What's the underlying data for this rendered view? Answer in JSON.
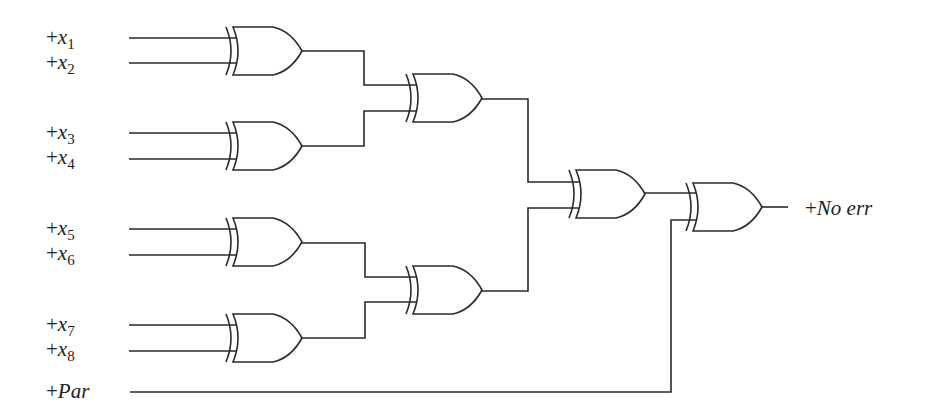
{
  "diagram": {
    "type": "xor-parity-checker",
    "inputs": [
      {
        "id": "x1",
        "plus": "+",
        "var": "x",
        "sub": "1"
      },
      {
        "id": "x2",
        "plus": "+",
        "var": "x",
        "sub": "2"
      },
      {
        "id": "x3",
        "plus": "+",
        "var": "x",
        "sub": "3"
      },
      {
        "id": "x4",
        "plus": "+",
        "var": "x",
        "sub": "4"
      },
      {
        "id": "x5",
        "plus": "+",
        "var": "x",
        "sub": "5"
      },
      {
        "id": "x6",
        "plus": "+",
        "var": "x",
        "sub": "6"
      },
      {
        "id": "x7",
        "plus": "+",
        "var": "x",
        "sub": "7"
      },
      {
        "id": "x8",
        "plus": "+",
        "var": "x",
        "sub": "8"
      }
    ],
    "parity_input": {
      "plus": "+",
      "name": "Par"
    },
    "output": {
      "plus": "+",
      "name": "No err"
    },
    "gates": [
      {
        "id": "g1",
        "type": "XOR",
        "inputs": [
          "x1",
          "x2"
        ]
      },
      {
        "id": "g2",
        "type": "XOR",
        "inputs": [
          "x3",
          "x4"
        ]
      },
      {
        "id": "g3",
        "type": "XOR",
        "inputs": [
          "x5",
          "x6"
        ]
      },
      {
        "id": "g4",
        "type": "XOR",
        "inputs": [
          "x7",
          "x8"
        ]
      },
      {
        "id": "g5",
        "type": "XOR",
        "inputs": [
          "g1",
          "g2"
        ]
      },
      {
        "id": "g6",
        "type": "XOR",
        "inputs": [
          "g3",
          "g4"
        ]
      },
      {
        "id": "g7",
        "type": "XOR",
        "inputs": [
          "g5",
          "g6"
        ]
      },
      {
        "id": "g8",
        "type": "XOR",
        "inputs": [
          "g7",
          "Par"
        ],
        "output": "No err"
      }
    ],
    "colors": {
      "line": "#2a2a2a",
      "background": "#ffffff",
      "text": "#222222"
    }
  }
}
